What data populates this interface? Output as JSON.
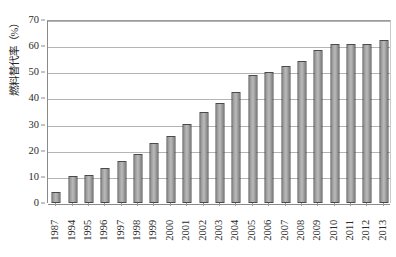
{
  "chart_data": {
    "type": "bar",
    "title": "",
    "subtitle": "",
    "xlabel": "",
    "ylabel": "燃料替代率（%）",
    "ylim": [
      0,
      70
    ],
    "ytick_step": 10,
    "yticks": [
      0,
      10,
      20,
      30,
      40,
      50,
      60,
      70
    ],
    "grid": true,
    "legend": false,
    "legend_position": "none",
    "categories": [
      "1987",
      "1994",
      "1995",
      "1996",
      "1997",
      "1998",
      "1999",
      "2000",
      "2001",
      "2002",
      "2003",
      "2004",
      "2005",
      "2006",
      "2007",
      "2008",
      "2009",
      "2010",
      "2011",
      "2012",
      "2013"
    ],
    "values": [
      4.2,
      10.2,
      10.7,
      13.5,
      16.0,
      18.8,
      22.9,
      25.8,
      30.3,
      34.9,
      38.4,
      42.3,
      48.8,
      50.1,
      52.5,
      54.5,
      58.5,
      61.0,
      61.0,
      61.0,
      62.2
    ],
    "series": [
      {
        "name": "燃料替代率（%）",
        "values": [
          4.2,
          10.2,
          10.7,
          13.5,
          16.0,
          18.8,
          22.9,
          25.8,
          30.3,
          34.9,
          38.4,
          42.3,
          48.8,
          50.1,
          52.5,
          54.5,
          58.5,
          61.0,
          61.0,
          61.0,
          62.2
        ]
      }
    ]
  },
  "style": {
    "bar_fill": "#b0b0b0",
    "bar_edge": "#4a4a4a",
    "gridline_color": "#b4b4b4",
    "axis_color": "#8a8a8a",
    "text_color": "#2b2b2b",
    "background": "#ffffff"
  }
}
